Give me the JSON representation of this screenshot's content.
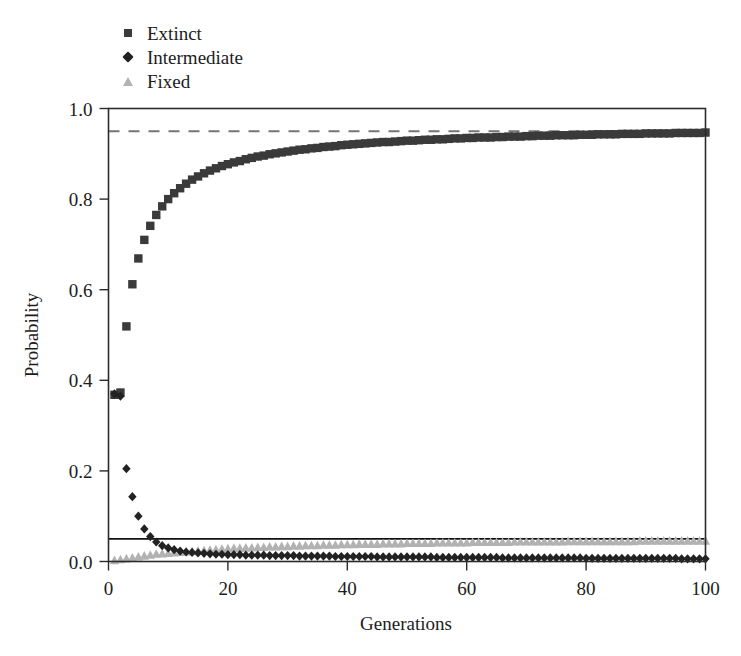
{
  "chart_data": {
    "type": "scatter",
    "title": "",
    "subtitle": "",
    "xlabel": "Generations",
    "ylabel": "Probability",
    "xlim": [
      0,
      100
    ],
    "ylim": [
      0.0,
      1.0
    ],
    "xticks": [
      0,
      20,
      40,
      60,
      80,
      100
    ],
    "yticks": [
      0.0,
      0.2,
      0.4,
      0.6,
      0.8,
      1.0
    ],
    "xtick_labels": [
      "0",
      "20",
      "40",
      "60",
      "80",
      "100"
    ],
    "ytick_labels": [
      "0.0",
      "0.2",
      "0.4",
      "0.6",
      "0.8",
      "1.0"
    ],
    "grid": false,
    "legend_position": "above-plot-left",
    "background_color": "#ffffff",
    "frame_color": "#2b2b2b",
    "annotations": [
      {
        "name": "extinction-asymptote",
        "type": "horizontal-line",
        "style": "dashed",
        "y": 0.95,
        "color": "#767676"
      },
      {
        "name": "fixation-asymptote",
        "type": "horizontal-line",
        "style": "solid",
        "y": 0.05,
        "color": "#111111"
      }
    ],
    "x": [
      1,
      2,
      3,
      4,
      5,
      6,
      7,
      8,
      9,
      10,
      11,
      12,
      13,
      14,
      15,
      16,
      17,
      18,
      19,
      20,
      21,
      22,
      23,
      24,
      25,
      26,
      27,
      28,
      29,
      30,
      31,
      32,
      33,
      34,
      35,
      36,
      37,
      38,
      39,
      40,
      41,
      42,
      43,
      44,
      45,
      46,
      47,
      48,
      49,
      50,
      51,
      52,
      53,
      54,
      55,
      56,
      57,
      58,
      59,
      60,
      61,
      62,
      63,
      64,
      65,
      66,
      67,
      68,
      69,
      70,
      71,
      72,
      73,
      74,
      75,
      76,
      77,
      78,
      79,
      80,
      81,
      82,
      83,
      84,
      85,
      86,
      87,
      88,
      89,
      90,
      91,
      92,
      93,
      94,
      95,
      96,
      97,
      98,
      99,
      100
    ],
    "series": [
      {
        "name": "Extinct",
        "marker": "square",
        "color": "#3a3a3a",
        "values": [
          0.368,
          0.373,
          0.519,
          0.612,
          0.669,
          0.71,
          0.741,
          0.765,
          0.784,
          0.8,
          0.813,
          0.824,
          0.834,
          0.843,
          0.85,
          0.857,
          0.863,
          0.868,
          0.873,
          0.877,
          0.881,
          0.884,
          0.888,
          0.891,
          0.894,
          0.896,
          0.899,
          0.901,
          0.903,
          0.905,
          0.907,
          0.909,
          0.91,
          0.912,
          0.913,
          0.915,
          0.916,
          0.917,
          0.919,
          0.92,
          0.921,
          0.922,
          0.923,
          0.924,
          0.925,
          0.926,
          0.926,
          0.927,
          0.928,
          0.929,
          0.929,
          0.93,
          0.931,
          0.931,
          0.932,
          0.932,
          0.933,
          0.934,
          0.934,
          0.935,
          0.935,
          0.936,
          0.936,
          0.936,
          0.937,
          0.937,
          0.938,
          0.938,
          0.938,
          0.939,
          0.939,
          0.94,
          0.94,
          0.94,
          0.941,
          0.941,
          0.941,
          0.941,
          0.942,
          0.942,
          0.942,
          0.943,
          0.943,
          0.943,
          0.943,
          0.944,
          0.944,
          0.944,
          0.944,
          0.945,
          0.945,
          0.945,
          0.945,
          0.945,
          0.946,
          0.946,
          0.946,
          0.946,
          0.946,
          0.947
        ]
      },
      {
        "name": "Intermediate",
        "marker": "diamond",
        "color": "#222222",
        "values": [
          0.37,
          0.365,
          0.205,
          0.143,
          0.1,
          0.072,
          0.055,
          0.043,
          0.035,
          0.03,
          0.026,
          0.023,
          0.021,
          0.02,
          0.019,
          0.018,
          0.017,
          0.016,
          0.016,
          0.015,
          0.015,
          0.015,
          0.014,
          0.014,
          0.014,
          0.014,
          0.013,
          0.013,
          0.013,
          0.013,
          0.013,
          0.012,
          0.012,
          0.012,
          0.012,
          0.012,
          0.012,
          0.011,
          0.011,
          0.011,
          0.011,
          0.011,
          0.011,
          0.011,
          0.01,
          0.01,
          0.01,
          0.01,
          0.01,
          0.01,
          0.01,
          0.01,
          0.01,
          0.01,
          0.009,
          0.009,
          0.009,
          0.009,
          0.009,
          0.009,
          0.009,
          0.009,
          0.009,
          0.009,
          0.009,
          0.008,
          0.008,
          0.008,
          0.008,
          0.008,
          0.008,
          0.008,
          0.008,
          0.008,
          0.008,
          0.008,
          0.008,
          0.008,
          0.008,
          0.007,
          0.007,
          0.007,
          0.007,
          0.007,
          0.007,
          0.007,
          0.007,
          0.007,
          0.007,
          0.007,
          0.007,
          0.007,
          0.007,
          0.007,
          0.007,
          0.006,
          0.006,
          0.006,
          0.006,
          0.006
        ]
      },
      {
        "name": "Fixed",
        "marker": "triangle",
        "color": "#b2b2b2",
        "values": [
          0.002,
          0.004,
          0.006,
          0.008,
          0.01,
          0.012,
          0.014,
          0.016,
          0.017,
          0.018,
          0.019,
          0.02,
          0.021,
          0.022,
          0.023,
          0.024,
          0.025,
          0.026,
          0.027,
          0.028,
          0.029,
          0.029,
          0.03,
          0.03,
          0.031,
          0.031,
          0.032,
          0.032,
          0.033,
          0.033,
          0.034,
          0.034,
          0.035,
          0.035,
          0.035,
          0.036,
          0.036,
          0.036,
          0.037,
          0.037,
          0.037,
          0.038,
          0.038,
          0.038,
          0.038,
          0.039,
          0.039,
          0.039,
          0.039,
          0.04,
          0.04,
          0.04,
          0.04,
          0.04,
          0.041,
          0.041,
          0.041,
          0.041,
          0.041,
          0.041,
          0.042,
          0.042,
          0.042,
          0.042,
          0.042,
          0.042,
          0.042,
          0.043,
          0.043,
          0.043,
          0.043,
          0.043,
          0.043,
          0.043,
          0.043,
          0.043,
          0.044,
          0.044,
          0.044,
          0.044,
          0.044,
          0.044,
          0.044,
          0.044,
          0.044,
          0.044,
          0.044,
          0.044,
          0.045,
          0.045,
          0.045,
          0.045,
          0.045,
          0.045,
          0.045,
          0.045,
          0.045,
          0.045,
          0.045,
          0.045
        ]
      }
    ]
  },
  "legend": {
    "items": [
      {
        "label": "Extinct",
        "marker": "square-marker",
        "color": "#3a3a3a"
      },
      {
        "label": "Intermediate",
        "marker": "diamond-marker",
        "color": "#222222"
      },
      {
        "label": "Fixed",
        "marker": "triangle-marker",
        "color": "#b2b2b2"
      }
    ]
  },
  "axes": {
    "x_title": "Generations",
    "y_title": "Probability"
  }
}
